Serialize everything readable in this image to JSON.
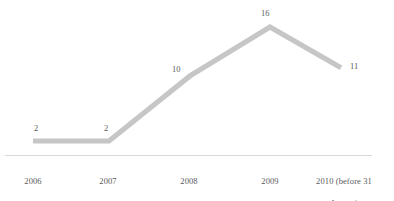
{
  "chart_data": {
    "type": "line",
    "title": "",
    "subtitle": "",
    "xlabel": "",
    "ylabel": "",
    "grid": false,
    "legend": "none",
    "categories": [
      "2006",
      "2007",
      "2008",
      "2009",
      "2010 (before 31 August)"
    ],
    "values": [
      2,
      2,
      10,
      16,
      11
    ],
    "point_labels": [
      "2",
      "2",
      "10",
      "16",
      "11"
    ],
    "ylim": [
      0,
      16
    ],
    "series": [
      {
        "name": "",
        "values": [
          2,
          2,
          10,
          16,
          11
        ]
      }
    ],
    "colors": {
      "line": "#c6c6c6",
      "axis": "#d9d9d9",
      "label_text": "#595959",
      "background": "#ffffff"
    }
  },
  "axis": {
    "tick_labels": [
      {
        "line1": "2006",
        "line2": ""
      },
      {
        "line1": "2007",
        "line2": ""
      },
      {
        "line1": "2008",
        "line2": ""
      },
      {
        "line1": "2009",
        "line2": ""
      },
      {
        "line1": "2010 (before 31",
        "line2": "August)"
      }
    ]
  },
  "labels": {
    "p0": "2",
    "p1": "2",
    "p2": "10",
    "p3": "16",
    "p4": "11"
  }
}
